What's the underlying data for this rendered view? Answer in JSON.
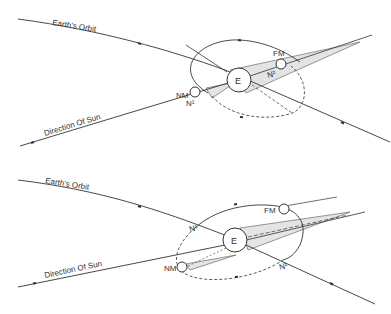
{
  "diagrams": [
    {
      "id": "top",
      "labels": {
        "orbit": "Earth's Orbit",
        "sun": "Direction Of Sun",
        "earth": "E",
        "full_moon": "FM",
        "new_moon": "NM",
        "node1": "N¹",
        "node2": "N²"
      }
    },
    {
      "id": "bottom",
      "labels": {
        "orbit": "Earth's Orbit",
        "sun": "Direction Of Sun",
        "earth": "E",
        "full_moon": "FM",
        "new_moon": "NM",
        "node1": "N¹",
        "node2": "N²"
      }
    }
  ],
  "colors": {
    "line": "#333333",
    "shadow": "#e4e4e4"
  }
}
